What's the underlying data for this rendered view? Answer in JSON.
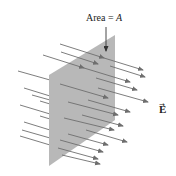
{
  "diagram": {
    "area_label": {
      "prefix": "Area = ",
      "symbol": "A"
    },
    "field_label": "E",
    "field_vector_mark": "→",
    "colors": {
      "plane": "#b8b8b8",
      "arrow": "#6e6e6e",
      "text": "#222222"
    },
    "plane_vertices": [
      [
        115,
        35
      ],
      [
        115,
        120
      ],
      [
        49,
        166
      ],
      [
        49,
        75
      ]
    ],
    "arrows": [
      {
        "x1": 60,
        "y1": 44,
        "x2": 104,
        "y2": 58
      },
      {
        "x1": 61,
        "y1": 52,
        "x2": 98,
        "y2": 64
      },
      {
        "x1": 43,
        "y1": 55,
        "x2": 84,
        "y2": 68
      },
      {
        "x1": 104,
        "y1": 58,
        "x2": 143,
        "y2": 70
      },
      {
        "x1": 110,
        "y1": 66,
        "x2": 145,
        "y2": 77
      },
      {
        "x1": 84,
        "y1": 68,
        "x2": 130,
        "y2": 82
      },
      {
        "x1": 18,
        "y1": 71,
        "x2": 50,
        "y2": 80
      },
      {
        "x1": 96,
        "y1": 78,
        "x2": 137,
        "y2": 90
      },
      {
        "x1": 60,
        "y1": 84,
        "x2": 108,
        "y2": 98
      },
      {
        "x1": 98,
        "y1": 88,
        "x2": 148,
        "y2": 102
      },
      {
        "x1": 24,
        "y1": 88,
        "x2": 50,
        "y2": 96
      },
      {
        "x1": 32,
        "y1": 95,
        "x2": 50,
        "y2": 100
      },
      {
        "x1": 88,
        "y1": 100,
        "x2": 130,
        "y2": 112
      },
      {
        "x1": 40,
        "y1": 101,
        "x2": 50,
        "y2": 104
      },
      {
        "x1": 68,
        "y1": 102,
        "x2": 118,
        "y2": 115
      },
      {
        "x1": 20,
        "y1": 105,
        "x2": 50,
        "y2": 114
      },
      {
        "x1": 82,
        "y1": 115,
        "x2": 123,
        "y2": 126
      },
      {
        "x1": 40,
        "y1": 116,
        "x2": 50,
        "y2": 119
      },
      {
        "x1": 64,
        "y1": 118,
        "x2": 114,
        "y2": 130
      },
      {
        "x1": 24,
        "y1": 122,
        "x2": 50,
        "y2": 130
      },
      {
        "x1": 86,
        "y1": 130,
        "x2": 127,
        "y2": 142
      },
      {
        "x1": 22,
        "y1": 130,
        "x2": 50,
        "y2": 138
      },
      {
        "x1": 68,
        "y1": 134,
        "x2": 108,
        "y2": 145
      },
      {
        "x1": 20,
        "y1": 136,
        "x2": 50,
        "y2": 145
      },
      {
        "x1": 60,
        "y1": 140,
        "x2": 103,
        "y2": 152
      },
      {
        "x1": 58,
        "y1": 148,
        "x2": 98,
        "y2": 159
      },
      {
        "x1": 62,
        "y1": 155,
        "x2": 100,
        "y2": 164
      }
    ]
  }
}
